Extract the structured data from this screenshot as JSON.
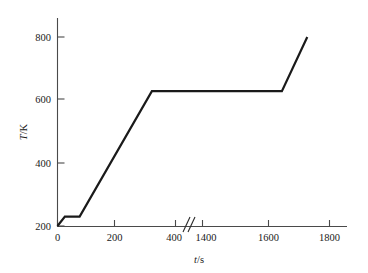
{
  "figure": {
    "background_color": "#ffffff",
    "line_color": "#1a1a1a",
    "axis_color": "#3a3a3a",
    "width": 368,
    "height": 273
  },
  "axes": {
    "y": {
      "title_var": "T",
      "title_sep": "/",
      "title_unit": "K",
      "title_full": "T/K",
      "tick_labels": [
        "200",
        "400",
        "600",
        "800"
      ],
      "tick_values": [
        200,
        400,
        600,
        800
      ],
      "min": 185,
      "max": 830
    },
    "x": {
      "title_var": "t",
      "title_sep": "/",
      "title_unit": "s",
      "title_full": "t/s",
      "tick_labels": [
        "0",
        "200",
        "400",
        "1400",
        "1600",
        "1800"
      ],
      "tick_values": [
        0,
        200,
        400,
        1400,
        1600,
        1800
      ],
      "break_marker": "//",
      "break_between": [
        400,
        1400
      ],
      "segment_left": [
        0,
        480
      ],
      "segment_right": [
        1330,
        1880
      ]
    }
  },
  "chart_data": {
    "type": "line",
    "title": "",
    "xlabel": "t/s",
    "ylabel": "T/K",
    "xlim": [
      0,
      1880
    ],
    "ylim": [
      185,
      830
    ],
    "grid": false,
    "legend": null,
    "axis_break": {
      "axis": "x",
      "from": 480,
      "to": 1330,
      "marker": "//"
    },
    "series": [
      {
        "name": "temperature",
        "color": "#1a1a1a",
        "x": [
          0,
          25,
          75,
          320,
          1650,
          1730
        ],
        "y": [
          200,
          230,
          230,
          628,
          628,
          800
        ],
        "points": [
          {
            "t": 0,
            "T": 200
          },
          {
            "t": 25,
            "T": 230
          },
          {
            "t": 75,
            "T": 230
          },
          {
            "t": 320,
            "T": 628
          },
          {
            "t": 1650,
            "T": 628
          },
          {
            "t": 1730,
            "T": 800
          }
        ]
      }
    ],
    "annotations": []
  }
}
